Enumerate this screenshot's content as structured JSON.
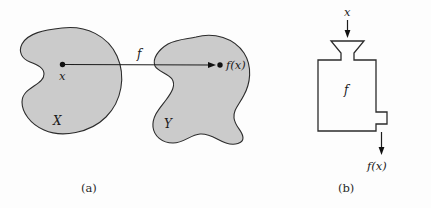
{
  "figure": {
    "panels": [
      {
        "id": "panel-a",
        "caption": "(a)",
        "kind": "set-mapping-diagram",
        "domain_set_label": "X",
        "codomain_set_label": "Y",
        "element_label": "x",
        "image_label": "f(x)",
        "map_label": "f"
      },
      {
        "id": "panel-b",
        "caption": "(b)",
        "kind": "function-machine-diagram",
        "input_label": "x",
        "machine_label": "f",
        "output_label": "f(x)"
      }
    ],
    "colors": {
      "blob_fill": "#cbcbcb",
      "blob_stroke": "#2b2b2b",
      "line": "#1d1d1d",
      "text": "#1a1a1a",
      "background": "#fdfdfd"
    }
  }
}
